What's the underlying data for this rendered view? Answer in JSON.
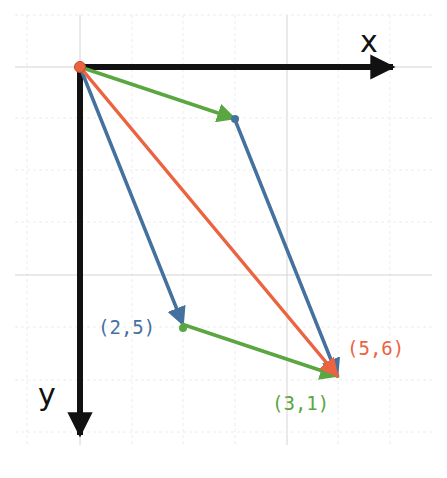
{
  "diagram": {
    "title": "",
    "axes": {
      "x_label": "x",
      "y_label": "y",
      "color": "#111111",
      "origin_px": [
        80,
        67
      ],
      "unit_px": 51.5,
      "y_direction": "down"
    },
    "grid": {
      "minor_color": "#ececec",
      "major_color": "#d4d4d4",
      "vertical_lines_px": [
        27,
        80,
        132,
        183,
        235,
        287,
        338,
        390
      ],
      "horizontal_lines_px": [
        15,
        67,
        118,
        170,
        222,
        275,
        327,
        380,
        432
      ],
      "major_vertical_px": [
        80,
        287
      ],
      "major_horizontal_px": [
        67,
        275
      ]
    },
    "vectors": [
      {
        "name": "a",
        "from": [
          0,
          0
        ],
        "to": [
          3,
          1
        ],
        "color": "#5aa641",
        "role": "green vector (3,1) from origin"
      },
      {
        "name": "b",
        "from": [
          3,
          1
        ],
        "to": [
          5,
          6
        ],
        "color": "#45719e",
        "role": "blue vector (2,5) translated"
      },
      {
        "name": "b",
        "from": [
          0,
          0
        ],
        "to": [
          2,
          5
        ],
        "color": "#45719e",
        "role": "blue vector (2,5) from origin"
      },
      {
        "name": "a",
        "from": [
          2,
          5
        ],
        "to": [
          5,
          6
        ],
        "color": "#5aa641",
        "role": "green vector (3,1) translated"
      },
      {
        "name": "a+b",
        "from": [
          0,
          0
        ],
        "to": [
          5,
          6
        ],
        "color": "#ec6341",
        "role": "red sum vector (5,6)"
      }
    ],
    "labels": [
      {
        "text": "(2,5)",
        "color": "#45719e",
        "x": 98,
        "y": 334
      },
      {
        "text": "(5,6)",
        "color": "#ec6341",
        "x": 347,
        "y": 355
      },
      {
        "text": "(3,1)",
        "color": "#5aa641",
        "x": 272,
        "y": 410
      }
    ],
    "origin_dot_color": "#ec6341"
  }
}
